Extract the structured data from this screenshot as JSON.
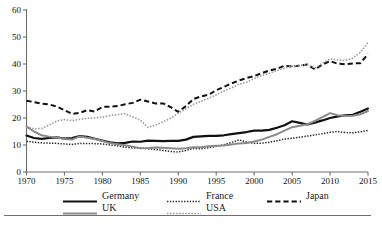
{
  "chart_data": {
    "type": "line",
    "title": "",
    "subtitle": "",
    "xlabel": "",
    "ylabel": "",
    "xlim": [
      1970,
      2015
    ],
    "ylim": [
      0,
      60
    ],
    "grid": false,
    "legend_position": "bottom",
    "xticks": [
      "1970",
      "1975",
      "1980",
      "1985",
      "1990",
      "1995",
      "2000",
      "2005",
      "2010",
      "2015"
    ],
    "yticks": [
      "0",
      "10",
      "20",
      "30",
      "40",
      "50",
      "60"
    ],
    "x": [
      1970,
      1971,
      1972,
      1973,
      1974,
      1975,
      1976,
      1977,
      1978,
      1979,
      1980,
      1981,
      1982,
      1983,
      1984,
      1985,
      1986,
      1987,
      1988,
      1989,
      1990,
      1991,
      1992,
      1993,
      1994,
      1995,
      1996,
      1997,
      1998,
      1999,
      2000,
      2001,
      2002,
      2003,
      2004,
      2005,
      2006,
      2007,
      2008,
      2009,
      2010,
      2011,
      2012,
      2013,
      2014,
      2015
    ],
    "series": [
      {
        "name": "Germany",
        "style": "solid",
        "color": "#111111",
        "width": 2.2,
        "values": [
          13.5,
          12.6,
          12.3,
          12.6,
          12.8,
          12.4,
          12.6,
          13.3,
          13.0,
          12.3,
          11.6,
          11.0,
          10.6,
          10.8,
          11.3,
          11.2,
          11.6,
          11.5,
          11.4,
          11.5,
          11.5,
          12.0,
          13.0,
          13.2,
          13.4,
          13.4,
          13.6,
          14.0,
          14.4,
          14.8,
          15.3,
          15.3,
          15.6,
          16.4,
          17.3,
          18.8,
          18.2,
          17.6,
          18.3,
          19.1,
          20.0,
          20.6,
          21.0,
          21.2,
          22.3,
          23.5
        ]
      },
      {
        "name": "France",
        "style": "dotted",
        "color": "#2b2b2b",
        "width": 1.5,
        "values": [
          11.4,
          11.0,
          10.8,
          10.7,
          10.6,
          10.4,
          10.2,
          10.6,
          10.6,
          10.5,
          10.4,
          10.0,
          9.7,
          9.2,
          8.9,
          9.0,
          8.6,
          8.3,
          8.0,
          7.6,
          7.4,
          8.0,
          8.7,
          8.6,
          9.0,
          9.5,
          10.1,
          10.9,
          11.9,
          11.1,
          10.6,
          10.7,
          11.0,
          11.6,
          12.2,
          12.5,
          12.9,
          13.3,
          13.7,
          14.2,
          14.7,
          15.0,
          14.6,
          14.5,
          14.9,
          15.4
        ]
      },
      {
        "name": "Japan",
        "style": "dashed",
        "color": "#111111",
        "width": 2.0,
        "values": [
          26.4,
          25.9,
          25.3,
          25.0,
          24.2,
          22.9,
          21.5,
          21.9,
          22.9,
          22.4,
          24.1,
          24.2,
          24.4,
          25.1,
          25.6,
          26.8,
          26.1,
          25.4,
          25.4,
          24.0,
          22.3,
          24.4,
          27.0,
          28.0,
          28.6,
          30.3,
          31.5,
          32.8,
          33.9,
          34.8,
          35.5,
          36.6,
          37.6,
          38.2,
          39.4,
          39.0,
          39.4,
          39.8,
          38.0,
          39.8,
          41.1,
          40.1,
          39.9,
          40.2,
          40.3,
          43.7
        ]
      },
      {
        "name": "UK",
        "style": "solid",
        "color": "#8a8a8a",
        "width": 2.0,
        "values": [
          16.8,
          15.0,
          13.6,
          13.1,
          12.8,
          12.2,
          12.0,
          13.2,
          12.7,
          12.2,
          11.5,
          10.7,
          10.3,
          9.9,
          9.4,
          8.8,
          8.9,
          9.1,
          9.0,
          8.8,
          8.6,
          8.8,
          9.2,
          9.2,
          9.5,
          9.7,
          9.8,
          10.2,
          10.6,
          10.7,
          11.3,
          12.0,
          13.0,
          14.0,
          15.3,
          16.6,
          17.1,
          17.7,
          18.9,
          20.3,
          21.8,
          21.0,
          20.7,
          20.8,
          21.4,
          22.6
        ]
      },
      {
        "name": "USA",
        "style": "dotted",
        "color": "#9a9a9a",
        "width": 1.6,
        "values": [
          17.0,
          15.9,
          16.2,
          17.4,
          18.9,
          19.4,
          19.0,
          19.5,
          19.9,
          20.0,
          20.3,
          20.9,
          21.3,
          21.6,
          20.4,
          19.2,
          16.5,
          17.4,
          18.6,
          19.9,
          21.8,
          23.4,
          25.1,
          26.2,
          27.3,
          28.6,
          30.0,
          31.1,
          32.5,
          33.3,
          34.6,
          35.7,
          36.6,
          37.5,
          38.5,
          39.2,
          39.5,
          39.8,
          38.4,
          40.3,
          41.9,
          41.5,
          41.3,
          42.2,
          44.3,
          48.0
        ]
      }
    ]
  },
  "legend": {
    "rows": [
      [
        {
          "label": "Germany",
          "key": "germany",
          "swatch": "solid-black-thick"
        },
        {
          "label": "France",
          "key": "france",
          "swatch": "dotted-dark"
        },
        {
          "label": "Japan",
          "key": "japan",
          "swatch": "dashed-black"
        }
      ],
      [
        {
          "label": "UK",
          "key": "uk",
          "swatch": "solid-gray"
        },
        {
          "label": "USA",
          "key": "usa",
          "swatch": "dotted-gray"
        }
      ]
    ]
  },
  "axes": {
    "axis_color": "#6f6f6f",
    "tick_color": "#6f6f6f"
  }
}
